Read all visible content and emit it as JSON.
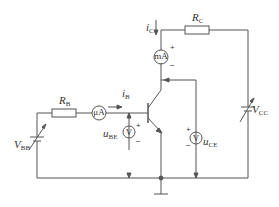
{
  "diagram": {
    "type": "transistor characteristic measurement circuit",
    "components": {
      "rb": {
        "label": "R",
        "sub": "B"
      },
      "rc": {
        "label": "R",
        "sub": "C"
      },
      "vbb": {
        "label": "V",
        "sub": "BB"
      },
      "vcc": {
        "label": "V",
        "sub": "CC"
      },
      "ib": {
        "label": "i",
        "sub": "B"
      },
      "ic": {
        "label": "i",
        "sub": "C"
      },
      "ube": {
        "label": "u",
        "sub": "BE"
      },
      "uce": {
        "label": "u",
        "sub": "CE"
      },
      "microammeter": {
        "text": "μA"
      },
      "milliammeter": {
        "text": "mA"
      },
      "voltmeter_be": {
        "text": "V"
      },
      "voltmeter_ce": {
        "text": "V"
      }
    },
    "signs": {
      "plus": "+",
      "minus": "−"
    },
    "colors": {
      "wire": "#555555",
      "text": "#333333"
    }
  }
}
